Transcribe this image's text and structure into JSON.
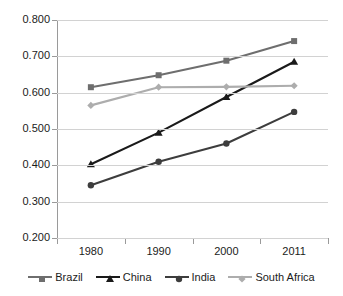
{
  "chart_data": {
    "type": "line",
    "title": "",
    "subtitle": "",
    "xlabel": "",
    "ylabel": "",
    "categories": [
      "1980",
      "1990",
      "2000",
      "2011"
    ],
    "ylim": [
      0.2,
      0.8
    ],
    "ytick_labels": [
      "0.800",
      "0.700",
      "0.600",
      "0.500",
      "0.400",
      "0.300",
      "0.200"
    ],
    "ytick_values": [
      0.8,
      0.7,
      0.6,
      0.5,
      0.4,
      0.3,
      0.2
    ],
    "grid": true,
    "legend_position": "bottom",
    "series": [
      {
        "name": "Brazil",
        "values": [
          0.615,
          0.648,
          0.688,
          0.742
        ],
        "color": "#6e6e6e",
        "marker": "square"
      },
      {
        "name": "China",
        "values": [
          0.403,
          0.49,
          0.588,
          0.685
        ],
        "color": "#1a1a1a",
        "marker": "triangle"
      },
      {
        "name": "India",
        "values": [
          0.345,
          0.41,
          0.46,
          0.547
        ],
        "color": "#3d3d3d",
        "marker": "circle"
      },
      {
        "name": "South Africa",
        "values": [
          0.565,
          0.615,
          0.616,
          0.619
        ],
        "color": "#adadad",
        "marker": "diamond"
      }
    ]
  },
  "axes": {
    "gridline_color": "#d2d2d2",
    "axis_color": "#9a9a9a",
    "background": "#ffffff",
    "text_color": "#1b1b1b"
  },
  "legend": {
    "items": [
      {
        "label": "Brazil"
      },
      {
        "label": "China"
      },
      {
        "label": "India"
      },
      {
        "label": "South Africa"
      }
    ]
  }
}
